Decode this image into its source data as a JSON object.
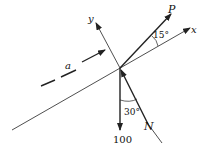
{
  "diagram": {
    "type": "free-body-diagram",
    "labels": {
      "x_axis": "x",
      "y_axis": "y",
      "force_p": "P",
      "force_n": "N",
      "weight": "100",
      "acceleration": "a",
      "angle_p": "15°",
      "angle_n": "30°"
    },
    "colors": {
      "line": "#222222",
      "background": "#ffffff"
    }
  }
}
